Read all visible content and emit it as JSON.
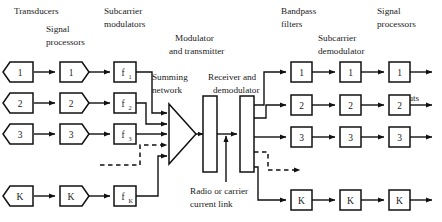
{
  "diagram": {
    "headers": {
      "transducers": "Transducers",
      "signal_processors_left": "Signal\nprocessors",
      "signal_processors_left_line1": "Signal",
      "signal_processors_left_line2": "processors",
      "subcarrier_modulators_line1": "Subcarrier",
      "subcarrier_modulators_line2": "modulators",
      "modulator_transmitter_line1": "Modulator",
      "modulator_transmitter_line2": "and transmitter",
      "summing_network_line1": "Summing",
      "summing_network_line2": "network",
      "receiver_demodulator_line1": "Receiver and",
      "receiver_demodulator_line2": "demodulator",
      "radio_link_line1": "Radio or carrier",
      "radio_link_line2": "current link",
      "bandpass_filters_line1": "Bandpass",
      "bandpass_filters_line2": "filters",
      "subcarrier_demodulator_line1": "Subcarrier",
      "subcarrier_demodulator_line2": "demodulator",
      "signal_processors_right_line1": "Signal",
      "signal_processors_right_line2": "processors",
      "outputs": "Outputs"
    },
    "transducers": [
      {
        "label": "1"
      },
      {
        "label": "2"
      },
      {
        "label": "3"
      },
      {
        "label": "K"
      }
    ],
    "signal_processors_left": [
      {
        "label": "1"
      },
      {
        "label": "2"
      },
      {
        "label": "3"
      },
      {
        "label": "K"
      }
    ],
    "subcarrier_modulators": [
      {
        "label": "f",
        "sub": "1"
      },
      {
        "label": "f",
        "sub": "2"
      },
      {
        "label": "f",
        "sub": "3"
      },
      {
        "label": "f",
        "sub": "K"
      }
    ],
    "bandpass_filters": [
      {
        "label": "1"
      },
      {
        "label": "2"
      },
      {
        "label": "3"
      },
      {
        "label": "K"
      }
    ],
    "subcarrier_demodulators": [
      {
        "label": "1"
      },
      {
        "label": "2"
      },
      {
        "label": "3"
      },
      {
        "label": "K"
      }
    ],
    "signal_processors_right": [
      {
        "label": "1"
      },
      {
        "label": "2"
      },
      {
        "label": "3"
      },
      {
        "label": "K"
      }
    ],
    "colors": {
      "line": "#111111",
      "text": "#1a1a1a",
      "background": "#ffffff"
    }
  }
}
